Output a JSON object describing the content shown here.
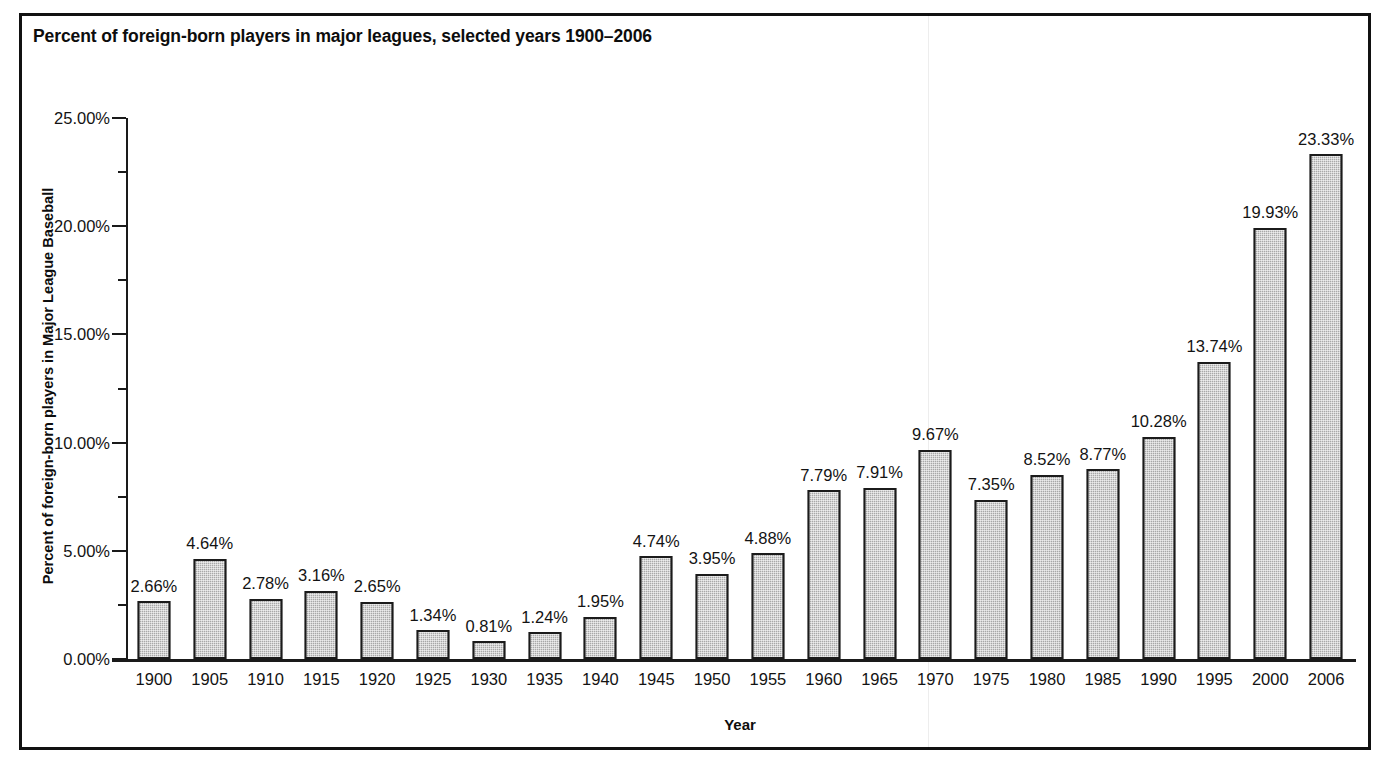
{
  "figure": {
    "title": "Percent of foreign-born players in major leagues, selected years 1900–2006",
    "x_axis_title": "Year",
    "y_axis_title": "Percent of foreign-born players in Major League Baseball",
    "bar_fill_color": "#a8a8a8",
    "bar_outline_color": "#1b1b1b",
    "frame_color": "#111111",
    "background_color": "#ffffff"
  },
  "chart_data": {
    "type": "bar",
    "title": "Percent of foreign-born players in major leagues, selected years 1900–2006",
    "xlabel": "Year",
    "ylabel": "Percent of foreign-born players in Major League Baseball",
    "ylim": [
      0,
      25
    ],
    "ytick_labels": [
      "25.00%",
      "20.00%",
      "15.00%",
      "10.00%",
      "5.00%",
      "0.00%"
    ],
    "ytick_values": [
      25,
      20,
      15,
      10,
      5,
      0
    ],
    "ytick_minor_values": [
      22.5,
      17.5,
      12.5,
      7.5,
      2.5
    ],
    "grid": false,
    "legend": false,
    "categories": [
      "1900",
      "1905",
      "1910",
      "1915",
      "1920",
      "1925",
      "1930",
      "1935",
      "1940",
      "1945",
      "1950",
      "1955",
      "1960",
      "1965",
      "1970",
      "1975",
      "1980",
      "1985",
      "1990",
      "1995",
      "2000",
      "2006"
    ],
    "values": [
      2.66,
      4.64,
      2.78,
      3.16,
      2.65,
      1.34,
      0.81,
      1.24,
      1.95,
      4.74,
      3.95,
      4.88,
      7.79,
      7.91,
      9.67,
      7.35,
      8.52,
      8.77,
      10.28,
      13.74,
      19.93,
      23.33
    ],
    "value_labels": [
      "2.66%",
      "4.64%",
      "2.78%",
      "3.16%",
      "2.65%",
      "1.34%",
      "0.81%",
      "1.24%",
      "1.95%",
      "4.74%",
      "3.95%",
      "4.88%",
      "7.79%",
      "7.91%",
      "9.67%",
      "7.35%",
      "8.52%",
      "8.77%",
      "10.28%",
      "13.74%",
      "19.93%",
      "23.33%"
    ]
  }
}
